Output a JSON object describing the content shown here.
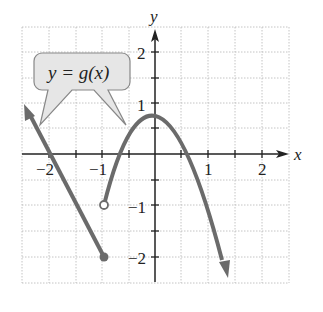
{
  "graph": {
    "function_label": "y = g(x)",
    "x_axis_label": "x",
    "y_axis_label": "y",
    "x_ticks": [
      "−2",
      "−1",
      "1",
      "2"
    ],
    "y_ticks": [
      "2",
      "1",
      "−1",
      "−2"
    ],
    "grid": {
      "spacing": 0.5,
      "xrange": [
        -2.5,
        2.5
      ],
      "yrange": [
        -2.5,
        2.5
      ]
    },
    "pieces": [
      {
        "type": "line",
        "description": "ray with arrow going up-left, through (-2,0), ending at closed point (-1,-2)"
      },
      {
        "type": "parabola",
        "description": "starts at open point (-1,-1), vertex (0,1), arrow downward at right"
      }
    ],
    "points": [
      {
        "x": -1,
        "y": -2,
        "style": "closed"
      },
      {
        "x": -1,
        "y": -1,
        "style": "open"
      }
    ],
    "colors": {
      "curve": "#6b6b6b",
      "axis": "#222222",
      "grid": "#b0b0b0",
      "callout_fill": "#e6e6e6"
    }
  }
}
